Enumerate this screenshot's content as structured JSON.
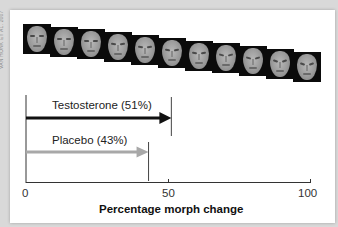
{
  "credit": "VAN HONK ET AL. 2007",
  "faces": {
    "count": 11,
    "description": "Morph sequence of face images from neutral to angry",
    "tiles": [
      {
        "x": 23,
        "y": 24
      },
      {
        "x": 50,
        "y": 27
      },
      {
        "x": 77,
        "y": 29
      },
      {
        "x": 104,
        "y": 32
      },
      {
        "x": 131,
        "y": 35
      },
      {
        "x": 158,
        "y": 38
      },
      {
        "x": 185,
        "y": 41
      },
      {
        "x": 212,
        "y": 43
      },
      {
        "x": 239,
        "y": 46
      },
      {
        "x": 266,
        "y": 49
      },
      {
        "x": 293,
        "y": 52
      }
    ]
  },
  "colors": {
    "testosterone": "#111111",
    "placebo": "#a8a8a8",
    "axis": "#333333"
  },
  "chart_data": {
    "type": "bar",
    "orientation": "horizontal",
    "title": "",
    "xlabel": "Percentage morph change",
    "ylabel": "",
    "xlim": [
      0,
      100
    ],
    "x_ticks": [
      0,
      50,
      100
    ],
    "categories": [
      "Testosterone (51%)",
      "Placebo (43%)"
    ],
    "series": [
      {
        "name": "Testosterone",
        "value": 51,
        "label": "Testosterone (51%)",
        "color": "#111111"
      },
      {
        "name": "Placebo",
        "value": 43,
        "label": "Placebo (43%)",
        "color": "#a8a8a8"
      }
    ],
    "grid": false,
    "legend": "none (inline labels above arrows)"
  },
  "labels": {
    "testosterone": "Testosterone (51%)",
    "placebo": "Placebo (43%)",
    "tick_0": "0",
    "tick_50": "50",
    "tick_100": "100",
    "xlabel": "Percentage morph change"
  }
}
